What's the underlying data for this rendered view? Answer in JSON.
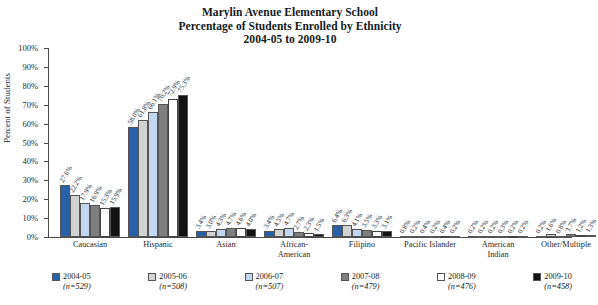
{
  "title": {
    "line1": "Marylin Avenue Elementary School",
    "line2": "Percentage of Students Enrolled by Ethnicity",
    "line3": "2004-05 to 2009-10"
  },
  "axis": {
    "ylabel": "Percent of Students",
    "yticks": [
      "0%",
      "10%",
      "20%",
      "30%",
      "40%",
      "50%",
      "60%",
      "70%",
      "80%",
      "90%",
      "100%"
    ]
  },
  "legend": [
    {
      "label": "2004-05",
      "n": "(n=529)",
      "color": "#2961A8"
    },
    {
      "label": "2005-06",
      "n": "(n=508)",
      "color": "#D2D2D2"
    },
    {
      "label": "2006-07",
      "n": "(n=507)",
      "color": "#C3D7F0"
    },
    {
      "label": "2007-08",
      "n": "(n=479)",
      "color": "#7F7F7F"
    },
    {
      "label": "2008-09",
      "n": "(n=476)",
      "color": "#FFFFFF"
    },
    {
      "label": "2009-10",
      "n": "(n=458)",
      "color": "#131313"
    }
  ],
  "chart_data": {
    "type": "bar",
    "title": "Marylin Avenue Elementary School Percentage of Students Enrolled by Ethnicity 2004-05 to 2009-10",
    "xlabel": "",
    "ylabel": "Percent of Students",
    "ylim": [
      0,
      100
    ],
    "grid": false,
    "legend_position": "bottom",
    "categories": [
      "Caucasian",
      "Hispanic",
      "Asian",
      "African-American",
      "Filipino",
      "Pacific Islander",
      "American Indian",
      "Other/Multiple"
    ],
    "series": [
      {
        "name": "2004-05",
        "values": [
          27.6,
          58.0,
          3.4,
          3.4,
          6.4,
          0.8,
          0.2,
          0.2
        ]
      },
      {
        "name": "2005-06",
        "values": [
          22.2,
          61.8,
          3.0,
          4.5,
          6.3,
          0.2,
          0.2,
          1.6
        ]
      },
      {
        "name": "2006-07",
        "values": [
          17.9,
          66.1,
          4.3,
          4.7,
          4.1,
          0.4,
          0.2,
          0.8
        ]
      },
      {
        "name": "2007-08",
        "values": [
          16.9,
          70.2,
          4.7,
          2.7,
          3.5,
          0.2,
          0.3,
          1.7
        ]
      },
      {
        "name": "2008-09",
        "values": [
          15.3,
          72.9,
          4.6,
          2.3,
          3.3,
          0.4,
          0.2,
          1.2
        ]
      },
      {
        "name": "2009-10",
        "values": [
          15.9,
          75.3,
          4.0,
          1.5,
          3.1,
          0.2,
          0.2,
          1.3
        ]
      }
    ],
    "bar_labels": [
      [
        "27.6%",
        "22.2%",
        "17.9%",
        "16.9%",
        "15.3%",
        "15.9%"
      ],
      [
        "58.0%",
        "61.8%",
        "66.1%",
        "70.2%",
        "72.9%",
        "75.3%"
      ],
      [
        "3.4%",
        "3.0%",
        "4.3%",
        "4.7%",
        "4.6%",
        "4.0%"
      ],
      [
        "3.4%",
        "4.5%",
        "4.7%",
        "2.7%",
        "2.3%",
        "1.5%"
      ],
      [
        "6.4%",
        "6.3%",
        "4.1%",
        "3.5%",
        "3.3%",
        "3.1%"
      ],
      [
        "0.8%",
        "0.2%",
        "0.4%",
        "0.2%",
        "0.4%",
        "0.2%"
      ],
      [
        "0.2%",
        "0.2%",
        "0.2%",
        "0.3%",
        "0.2%",
        "0.2%"
      ],
      [
        "0.2%",
        "1.6%",
        "0.8%",
        "1.7%",
        "1.2%",
        "1.3%"
      ]
    ]
  }
}
